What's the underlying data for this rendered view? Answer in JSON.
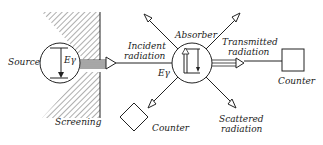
{
  "diagram": {
    "labels": {
      "source": "Source",
      "screening": "Screening",
      "incident_1": "Incident",
      "incident_2": "radiation",
      "absorber": "Absorber",
      "transmitted_1": "Transmitted",
      "transmitted_2": "radiation",
      "scattered_1": "Scattered",
      "scattered_2": "radiation",
      "counter_right": "Counter",
      "counter_bottom": "Counter",
      "e_gamma_source": "Eγ",
      "e_gamma_absorber": "Eγ"
    },
    "colors": {
      "ink": "#222222",
      "background": "#ffffff"
    }
  }
}
